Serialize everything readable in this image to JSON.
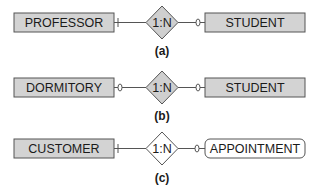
{
  "diagram": {
    "type": "er-diagram",
    "colors": {
      "entity_fill": "#d3d3d3",
      "weak_entity_fill": "#ffffff",
      "relationship_fill": "#cfcfcf",
      "relationship_fill_white": "#ffffff",
      "stroke": "#555555",
      "text": "#1a1a1a"
    },
    "parts": [
      {
        "caption": "(a)",
        "left_entity": "PROFESSOR",
        "left_entity_style": "strong",
        "left_marker": "bar",
        "relationship": "1:N",
        "relationship_style": "gray",
        "right_marker": "circle",
        "right_entity": "STUDENT",
        "right_entity_style": "strong"
      },
      {
        "caption": "(b)",
        "left_entity": "DORMITORY",
        "left_entity_style": "strong",
        "left_marker": "circle",
        "relationship": "1:N",
        "relationship_style": "gray",
        "right_marker": "circle",
        "right_entity": "STUDENT",
        "right_entity_style": "strong"
      },
      {
        "caption": "(c)",
        "left_entity": "CUSTOMER",
        "left_entity_style": "strong",
        "left_marker": "bar",
        "relationship": "1:N",
        "relationship_style": "white",
        "right_marker": "circle",
        "right_entity": "APPOINTMENT",
        "right_entity_style": "rounded"
      }
    ]
  }
}
